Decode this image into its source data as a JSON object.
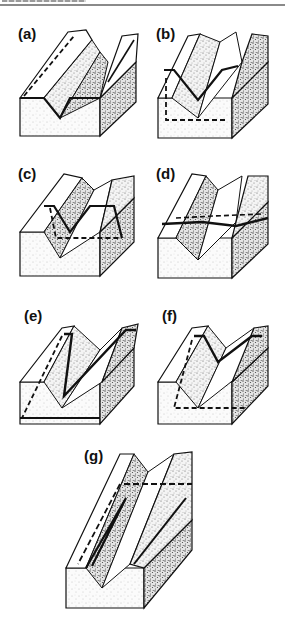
{
  "header": {
    "text_visible": false
  },
  "figure": {
    "type": "block-diagram-panels",
    "panels": [
      {
        "id": "a",
        "label": "(a)",
        "x": 4,
        "y": 22,
        "trace": "solid line along valley floor/flanks; dashed line on left ridge"
      },
      {
        "id": "b",
        "label": "(b)",
        "x": 142,
        "y": 22,
        "trace": "solid V across valleys; dashed rectangle on front face"
      },
      {
        "id": "c",
        "label": "(c)",
        "x": 4,
        "y": 162,
        "trace": "solid V pointing down-valley; dashed horizontal on front"
      },
      {
        "id": "d",
        "label": "(d)",
        "x": 142,
        "y": 162,
        "trace": "near-horizontal solid trace with dashed segment"
      },
      {
        "id": "e",
        "label": "(e)",
        "x": 4,
        "y": 300,
        "trace": "sharp solid V; dashed diagonal on left face; solid base line"
      },
      {
        "id": "f",
        "label": "(f)",
        "x": 142,
        "y": 300,
        "trace": "solid V; dashed L on front face"
      },
      {
        "id": "g",
        "label": "(g)",
        "x": 64,
        "y": 440,
        "trace": "solid V along valley; dashed lines along ridge top"
      }
    ]
  },
  "colors": {
    "ink": "#111111",
    "stipple_dark": "#6a6a6a",
    "stipple_light": "#c9c9c9",
    "paper": "#ffffff"
  }
}
